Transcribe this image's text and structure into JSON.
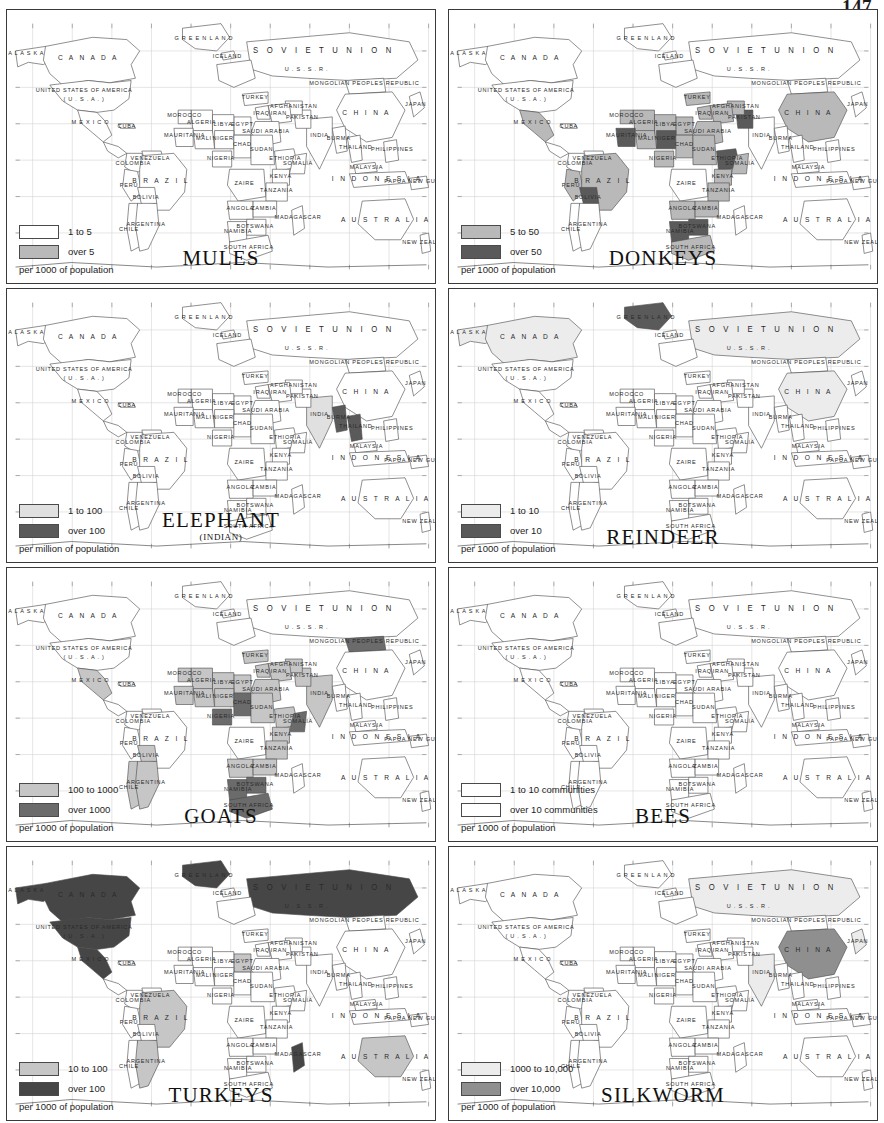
{
  "page": {
    "folio": "147"
  },
  "palette": {
    "light": "#e9e9e9",
    "mid": "#b9b9b9",
    "dark": "#5a5a5a",
    "darker": "#4a4a4a",
    "white": "#ffffff",
    "outline": "#4a4a4a",
    "graticule": "#cfcfcf",
    "border": "#3a3a3a"
  },
  "map_labels": {
    "alaska": "A L A S K A",
    "canada": "C A N A D A",
    "usa_line1": "UNITED STATES OF AMERICA",
    "usa_line2": "( U . S . A . )",
    "mexico": "M E X I C O",
    "cuba": "CUBA",
    "venezuela": "VENEZUELA",
    "colombia": "COLOMBIA",
    "peru": "PERU",
    "brazil": "B R A Z I L",
    "bolivia": "BOLIVIA",
    "chile": "CHILE",
    "argentina": "ARGENTINA",
    "greenland": "G R E E N L A N D",
    "iceland": "ICELAND",
    "soviet_union": "S O V I E T      U N I O N",
    "ussr": "U . S . S . R .",
    "mongolia": "MONGOLIAN PEOPLES REPUBLIC",
    "china": "C H I N A",
    "japan": "JAPAN",
    "india": "INDIA",
    "pakistan": "PAKISTAN",
    "iran": "IRAN",
    "iraq": "IRAQ",
    "turkey": "TURKEY",
    "saudi": "SAUDI ARABIA",
    "egypt": "EGYPT",
    "libya": "LIBYA",
    "algeria": "ALGERIA",
    "nigeria": "NIGERIA",
    "niger": "NIGER",
    "chad": "CHAD",
    "sudan": "SUDAN",
    "ethiopia": "ETHIOPIA",
    "somalia": "SOMALIA",
    "kenya": "KENYA",
    "zaire": "ZAIRE",
    "tanzania": "TANZANIA",
    "angola": "ANGOLA",
    "zambia": "ZAMBIA",
    "namibia": "NAMIBIA",
    "botswana": "BOTSWANA",
    "south_africa": "SOUTH AFRICA",
    "madagascar": "MADAGASCAR",
    "morocco": "MOROCCO",
    "mali": "MALI",
    "mauritania": "MAURITANIA",
    "burma": "BURMA",
    "thailand": "THAILAND",
    "indonesia": "I N D O N E S I A",
    "philippines": "PHILIPPINES",
    "malaysia": "MALAYSIA",
    "australia": "A U S T R A L I A",
    "new_zealand": "NEW ZEALAND",
    "papua": "PAPUA NEW GUINEA",
    "afghanistan": "AFGHANISTAN"
  },
  "maps": [
    {
      "id": "mules",
      "title": "MULES",
      "subtitle": "",
      "unit": "per 1000 of population",
      "legend": [
        {
          "label": "1 to 5",
          "fill": "#ffffff"
        },
        {
          "label": "over 5",
          "fill": "#b9b9b9"
        }
      ],
      "shading": {
        "base": "#ffffff",
        "mid": [
          "brazil",
          "mexico",
          "ethiopia",
          "south_africa",
          "algeria",
          "bolivia",
          "peru",
          "chile",
          "argentina",
          "colombia",
          "venezuela",
          "morocco"
        ],
        "dark": []
      }
    },
    {
      "id": "donkeys",
      "title": "DONKEYS",
      "subtitle": "",
      "unit": "per 1000 of population",
      "legend": [
        {
          "label": "5 to 50",
          "fill": "#b9b9b9"
        },
        {
          "label": "over 50",
          "fill": "#5a5a5a"
        }
      ],
      "shading": {
        "base": "#ffffff",
        "mid": [
          "brazil",
          "mexico",
          "china",
          "peru",
          "algeria",
          "libya",
          "egypt",
          "sudan",
          "chad",
          "nigeria",
          "turkey",
          "iran",
          "iraq",
          "saudi",
          "somalia",
          "kenya",
          "tanzania",
          "angola",
          "zambia",
          "south_africa",
          "botswana",
          "namibia",
          "mali",
          "morocco",
          "afghanistan"
        ],
        "dark": [
          "bolivia",
          "ethiopia",
          "niger",
          "pakistan",
          "botswana",
          "namibia",
          "mauritania"
        ]
      }
    },
    {
      "id": "elephant",
      "title": "ELEPHANT",
      "subtitle": "(INDIAN)",
      "unit": "per million of population",
      "legend": [
        {
          "label": "1 to 100",
          "fill": "#e0e0e0"
        },
        {
          "label": "over 100",
          "fill": "#5a5a5a"
        }
      ],
      "shading": {
        "base": "#ffffff",
        "mid": [
          "india"
        ],
        "dark": [
          "burma",
          "thailand"
        ]
      }
    },
    {
      "id": "reindeer",
      "title": "REINDEER",
      "subtitle": "",
      "unit": "per 1000 of population",
      "legend": [
        {
          "label": "1 to 10",
          "fill": "#ececec"
        },
        {
          "label": "over 10",
          "fill": "#5a5a5a"
        }
      ],
      "shading": {
        "base": "#ffffff",
        "mid": [
          "canada",
          "soviet_union",
          "china",
          "alaska"
        ],
        "dark": [
          "greenland"
        ]
      }
    },
    {
      "id": "goats",
      "title": "GOATS",
      "subtitle": "",
      "unit": "per 1000 of population",
      "legend": [
        {
          "label": "100 to 1000",
          "fill": "#c6c6c6"
        },
        {
          "label": "over 1000",
          "fill": "#6b6b6b"
        }
      ],
      "shading": {
        "base": "#ffffff",
        "mid": [
          "algeria",
          "libya",
          "egypt",
          "sudan",
          "chad",
          "niger",
          "nigeria",
          "ethiopia",
          "somalia",
          "kenya",
          "tanzania",
          "zambia",
          "angola",
          "south_africa",
          "turkey",
          "iran",
          "iraq",
          "saudi",
          "pakistan",
          "india",
          "mexico",
          "bolivia",
          "argentina",
          "chile",
          "morocco",
          "mali",
          "mauritania",
          "afghanistan"
        ],
        "dark": [
          "mongolia",
          "nigeria",
          "chad",
          "somalia",
          "botswana",
          "namibia",
          "south_africa"
        ]
      }
    },
    {
      "id": "bees",
      "title": "BEES",
      "subtitle": "",
      "unit": "per 1000 of population",
      "legend": [
        {
          "label": "1 to 10 communities",
          "fill": "#ffffff"
        },
        {
          "label": "over 10 communities",
          "fill": "#ffffff"
        }
      ],
      "shading": {
        "base": "#ffffff",
        "mid": [],
        "dark": []
      }
    },
    {
      "id": "turkeys",
      "title": "TURKEYS",
      "subtitle": "",
      "unit": "per 1000 of population",
      "legend": [
        {
          "label": "10 to 100",
          "fill": "#c6c6c6"
        },
        {
          "label": "over 100",
          "fill": "#464646"
        }
      ],
      "shading": {
        "base": "#ffffff",
        "mid": [
          "brazil",
          "australia",
          "egypt",
          "argentina"
        ],
        "dark": [
          "canada",
          "usa",
          "soviet_union",
          "alaska",
          "mexico",
          "madagascar",
          "greenland"
        ]
      }
    },
    {
      "id": "silkworm",
      "title": "SILKWORM",
      "subtitle": "",
      "unit": "per 1000 of population",
      "legend": [
        {
          "label": "1000 to 10,000",
          "fill": "#ececec"
        },
        {
          "label": "over 10,000",
          "fill": "#8f8f8f"
        }
      ],
      "shading": {
        "base": "#ffffff",
        "mid": [
          "soviet_union",
          "india",
          "japan"
        ],
        "dark": [
          "china"
        ]
      }
    }
  ]
}
